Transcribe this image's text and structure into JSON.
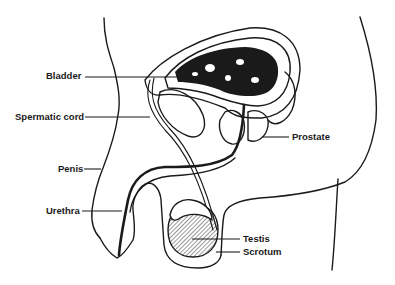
{
  "diagram": {
    "type": "anatomical-cross-section",
    "labels": {
      "bladder": "Bladder",
      "spermatic_cord": "Spermatic cord",
      "penis": "Penis",
      "urethra": "Urethra",
      "prostate": "Prostate",
      "testis": "Testis",
      "scrotum": "Scrotum"
    },
    "colors": {
      "ink": "#1a1a1a",
      "background": "#ffffff"
    }
  }
}
